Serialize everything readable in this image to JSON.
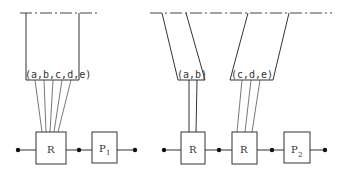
{
  "left_diagram": {
    "set_label": "(a,b,c,d,e)",
    "router_label": "R",
    "process_label": "P",
    "process_subscript": "1"
  },
  "right_diagram": {
    "set_label_left": "(a,b)",
    "set_label_right": "(c,d,e)",
    "router_label_1": "R",
    "router_label_2": "R",
    "process_label": "P",
    "process_subscript": "2"
  }
}
